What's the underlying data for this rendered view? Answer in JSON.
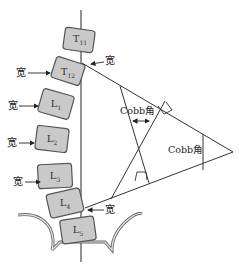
{
  "diagram": {
    "vertebrae": [
      {
        "id": "T11",
        "letter": "T",
        "sub": "11"
      },
      {
        "id": "T12",
        "letter": "T",
        "sub": "12"
      },
      {
        "id": "L1",
        "letter": "L",
        "sub": "1"
      },
      {
        "id": "L2",
        "letter": "L",
        "sub": "2"
      },
      {
        "id": "L3",
        "letter": "L",
        "sub": "3"
      },
      {
        "id": "L4",
        "letter": "L",
        "sub": "4"
      },
      {
        "id": "L5",
        "letter": "L",
        "sub": "5"
      }
    ],
    "arrow_labels": {
      "wide": "宽"
    },
    "angle_labels": {
      "inner": "Cobb角",
      "outer": "Cobb角"
    },
    "colors": {
      "vertebra_fill": "#c9c9c9",
      "vertebra_stroke": "#555555",
      "line": "#333333",
      "pelvis_fill": "#e2e2e2"
    }
  }
}
